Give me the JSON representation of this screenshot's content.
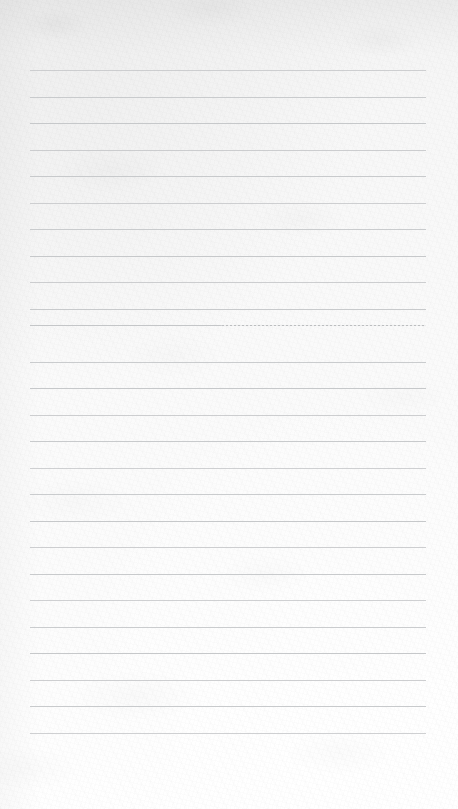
{
  "document": {
    "kind": "lined-notebook-paper-scan",
    "title": "",
    "body_text": "",
    "visible_text": [],
    "page_width": 458,
    "page_height": 809
  },
  "paper": {
    "background_color": "#fbfbfb",
    "tint_top_left": "#efefef",
    "tint_bottom_right": "#ffffff",
    "texture": "mottled scan grain"
  },
  "ruling": {
    "line_color": "#c4c6c8",
    "line_thickness_px": 1,
    "line_count": 26,
    "first_line_y": 70,
    "line_spacing_px": 26.5,
    "left_margin_x": 30,
    "right_margin_x": 426,
    "line_length_px": 396,
    "faded_line_index": 10,
    "faded_line_note": "rule partially broken into a dotted/hairline trace across its right half",
    "lines_y": [
      70,
      96.5,
      123,
      149.5,
      176,
      202.5,
      229,
      255.5,
      282,
      308.5,
      325,
      361.5,
      388,
      414.5,
      441,
      467.5,
      494,
      520.5,
      547,
      573.5,
      600,
      626.5,
      653,
      679.5,
      706,
      732.5
    ]
  },
  "margins": {
    "top_blank_px": 70,
    "bottom_blank_px": 76
  }
}
